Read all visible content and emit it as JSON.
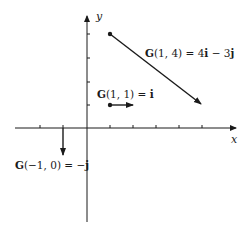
{
  "diagram": {
    "type": "vector_field_sample",
    "axes": {
      "x_label": "x",
      "y_label": "y",
      "origin_px": [
        87,
        128
      ],
      "unit_px": 23.3,
      "x_ticks": [
        -2,
        -1,
        1,
        2,
        3,
        4,
        5
      ],
      "y_ticks": [
        1,
        2,
        3,
        4
      ],
      "x_range": [
        -3,
        6.3
      ],
      "y_range": [
        -4.5,
        4.8
      ]
    },
    "vectors": [
      {
        "name": "G(1, 4)",
        "tail": [
          1,
          4
        ],
        "components": [
          4,
          -3
        ],
        "label_func": "G",
        "label_args": "(1, 4)",
        "label_eq": " = 4",
        "label_parts": [
          {
            "text": "G",
            "bold": true
          },
          {
            "text": "(1, 4) = 4",
            "bold": false
          },
          {
            "text": "i",
            "bold": true
          },
          {
            "text": " − 3",
            "bold": false
          },
          {
            "text": "j",
            "bold": true
          }
        ],
        "label_pos_px": [
          145,
          57
        ]
      },
      {
        "name": "G(1, 1)",
        "tail": [
          1,
          1
        ],
        "components": [
          1,
          0
        ],
        "label_parts": [
          {
            "text": "G",
            "bold": true
          },
          {
            "text": "(1, 1) = ",
            "bold": false
          },
          {
            "text": "i",
            "bold": true
          }
        ],
        "label_pos_px": [
          97,
          98
        ]
      },
      {
        "name": "G(-1, 0)",
        "tail": [
          -1,
          0
        ],
        "components": [
          0,
          -1
        ],
        "label_parts": [
          {
            "text": "G",
            "bold": true
          },
          {
            "text": "(−1, 0) = −",
            "bold": false
          },
          {
            "text": "j",
            "bold": true
          }
        ],
        "label_pos_px": [
          15,
          169
        ]
      }
    ],
    "colors": {
      "ink": "#1a1a1a",
      "background": "#ffffff"
    }
  },
  "labels": {
    "x_axis": "x",
    "y_axis": "y",
    "v1": {
      "p1": "G",
      "p2": "(1, 4) = 4",
      "p3": "i",
      "p4": " − 3",
      "p5": "j"
    },
    "v2": {
      "p1": "G",
      "p2": "(1, 1) = ",
      "p3": "i"
    },
    "v3": {
      "p1": "G",
      "p2": "(−1, 0) = −",
      "p3": "j"
    }
  }
}
